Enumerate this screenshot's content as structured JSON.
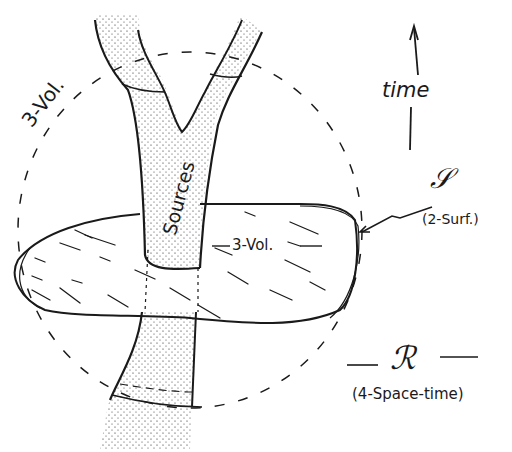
{
  "diagram": {
    "labels": {
      "time": "time",
      "sources": "Sources",
      "three_vol_outer": "3-Vol.",
      "three_vol_inner": "3-Vol.",
      "surface_symbol": "𝒮",
      "surface_desc": "(2-Surf.)",
      "region_symbol": "ℛ",
      "region_desc": "(4-Space-time)"
    },
    "colors": {
      "ink": "#1a1a1a",
      "paper": "#ffffff"
    }
  }
}
